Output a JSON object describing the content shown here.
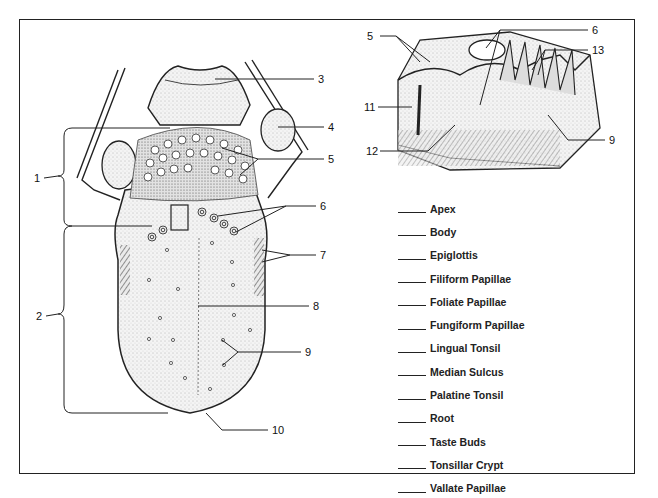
{
  "diagram": {
    "main_callouts": [
      {
        "num": "1",
        "x": 34,
        "y": 174
      },
      {
        "num": "2",
        "x": 36,
        "y": 312
      },
      {
        "num": "3",
        "x": 318,
        "y": 75
      },
      {
        "num": "4",
        "x": 328,
        "y": 123
      },
      {
        "num": "5",
        "x": 328,
        "y": 155
      },
      {
        "num": "6",
        "x": 320,
        "y": 203
      },
      {
        "num": "7",
        "x": 320,
        "y": 251
      },
      {
        "num": "8",
        "x": 313,
        "y": 304
      },
      {
        "num": "9",
        "x": 305,
        "y": 350
      },
      {
        "num": "10",
        "x": 272,
        "y": 426
      }
    ],
    "inset_callouts": [
      {
        "num": "5",
        "x": 367,
        "y": 34
      },
      {
        "num": "6",
        "x": 592,
        "y": 27
      },
      {
        "num": "13",
        "x": 593,
        "y": 47
      },
      {
        "num": "11",
        "x": 364,
        "y": 104
      },
      {
        "num": "12",
        "x": 366,
        "y": 148
      },
      {
        "num": "9",
        "x": 609,
        "y": 134
      }
    ],
    "terms": [
      "Apex",
      "Body",
      "Epiglottis",
      "Filiform Papillae",
      "Foliate Papillae",
      "Fungiform Papillae",
      "Lingual Tonsil",
      "Median Sulcus",
      "Palatine Tonsil",
      "Root",
      "Taste Buds",
      "Tonsillar Crypt",
      "Vallate Papillae"
    ]
  }
}
